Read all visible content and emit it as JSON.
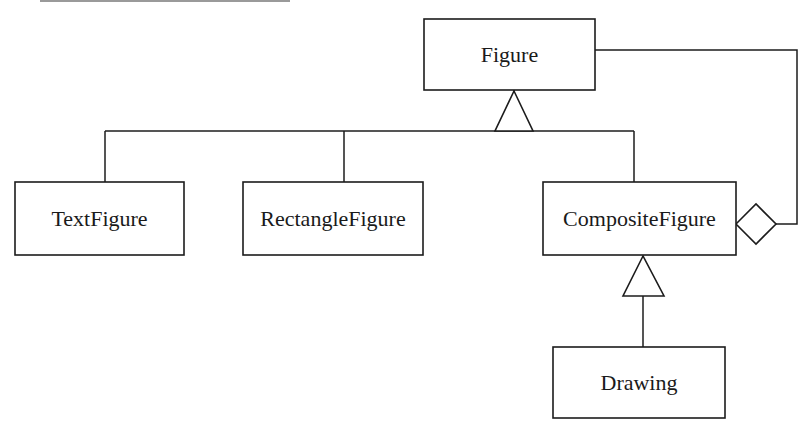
{
  "diagram": {
    "type": "UML class diagram (Composite pattern)",
    "classes": [
      {
        "id": "figure",
        "name": "Figure",
        "x": 424,
        "y": 19,
        "w": 171,
        "h": 71
      },
      {
        "id": "text_figure",
        "name": "TextFigure",
        "x": 15,
        "y": 182,
        "w": 169,
        "h": 73
      },
      {
        "id": "rectangle_figure",
        "name": "RectangleFigure",
        "x": 243,
        "y": 182,
        "w": 180,
        "h": 73
      },
      {
        "id": "composite_figure",
        "name": "CompositeFigure",
        "x": 543,
        "y": 182,
        "w": 193,
        "h": 73
      },
      {
        "id": "drawing",
        "name": "Drawing",
        "x": 553,
        "y": 347,
        "w": 172,
        "h": 71
      }
    ],
    "relationships": [
      {
        "type": "generalization",
        "from": "TextFigure",
        "to": "Figure"
      },
      {
        "type": "generalization",
        "from": "RectangleFigure",
        "to": "Figure"
      },
      {
        "type": "generalization",
        "from": "CompositeFigure",
        "to": "Figure"
      },
      {
        "type": "generalization",
        "from": "Drawing",
        "to": "CompositeFigure"
      },
      {
        "type": "aggregation",
        "whole": "CompositeFigure",
        "part": "Figure"
      }
    ],
    "colors": {
      "stroke": "#1c1c1c",
      "background": "#ffffff",
      "text": "#1a1a1a"
    }
  }
}
